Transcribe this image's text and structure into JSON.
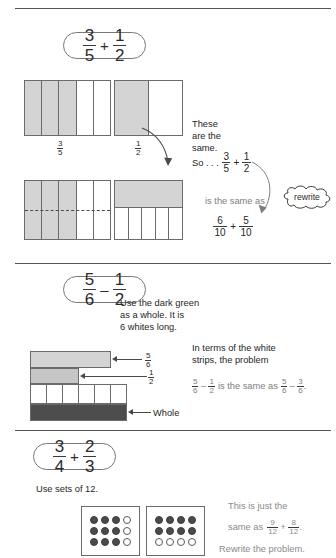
{
  "meta": {
    "colors": {
      "shade": "#d4d4d4",
      "dark_strip": "#4d4d4d",
      "rule": "#555555",
      "outline": "#6b6b6b",
      "grey_text": "#7d7d7d",
      "body_text": "#262626"
    }
  },
  "section1": {
    "problem": {
      "left": {
        "num": "3",
        "den": "5"
      },
      "operator": "+",
      "right": {
        "num": "1",
        "den": "2"
      }
    },
    "labels": {
      "three_fifths": {
        "num": "3",
        "den": "5"
      },
      "one_half": {
        "num": "1",
        "den": "2"
      }
    },
    "notes": {
      "line1": "These",
      "line2": "are the",
      "line3": "same.",
      "so_prefix": "So . . .",
      "so_left": {
        "num": "3",
        "den": "5"
      },
      "so_operator": "+",
      "so_right": {
        "num": "1",
        "den": "2"
      },
      "is_same_as": "is the same as",
      "result_left": {
        "num": "6",
        "den": "10"
      },
      "result_operator": "+",
      "result_right": {
        "num": "5",
        "den": "10"
      },
      "cloud_label": "rewrite"
    },
    "models": {
      "top_left_bar": {
        "parts": 5,
        "shaded": 3,
        "label": "3/5"
      },
      "top_right_bar": {
        "parts": 2,
        "shaded": 1,
        "label": "1/2"
      },
      "bottom_left_bar": {
        "parts": 5,
        "shaded": 3,
        "horizontal_split": true,
        "split_style": "dashed",
        "label": "6/10"
      },
      "bottom_right_bar": {
        "top_shaded": true,
        "bottom_parts": 5,
        "label": "5/10"
      }
    }
  },
  "section2": {
    "problem": {
      "left": {
        "num": "5",
        "den": "6"
      },
      "operator": "–",
      "right": {
        "num": "1",
        "den": "2"
      }
    },
    "instruction": {
      "line1": "Use the dark green",
      "line2": "as a whole. It is",
      "line3": "6 whites long."
    },
    "strip_labels": {
      "five_sixths": {
        "num": "5",
        "den": "6"
      },
      "one_half": {
        "num": "1",
        "den": "2"
      },
      "whole": "Whole"
    },
    "explanation": {
      "line1": "In terms of the white",
      "line2": "strips, the problem",
      "eq_left": {
        "num": "5",
        "den": "6"
      },
      "eq_operator": "–",
      "eq_right": {
        "num": "1",
        "den": "2"
      },
      "eq_middle": "is the same as",
      "eq_result_left": {
        "num": "5",
        "den": "6"
      },
      "eq_result_operator": "–",
      "eq_result_right": {
        "num": "3",
        "den": "6"
      },
      "eq_period": "."
    },
    "models": {
      "five_sixths_strip": {
        "units": 5,
        "of_total": 6,
        "shade": "light-green"
      },
      "one_half_strip": {
        "units": 3,
        "of_total": 6,
        "shade": "mid-green"
      },
      "white_strip_row": {
        "units": 6
      },
      "whole_strip": {
        "units": 6,
        "shade": "dark-green"
      }
    }
  },
  "section3": {
    "problem": {
      "left": {
        "num": "3",
        "den": "4"
      },
      "operator": "+",
      "right": {
        "num": "2",
        "den": "3"
      }
    },
    "instruction": "Use sets of 12.",
    "explanation": {
      "line1": "This is just the",
      "line2_prefix": "same as",
      "eq_left": {
        "num": "9",
        "den": "12"
      },
      "eq_operator": "+",
      "eq_right": {
        "num": "8",
        "den": "12"
      },
      "eq_period": ".",
      "line3": "Rewrite the problem."
    },
    "dot_sets": [
      {
        "name": "three-fourths-set",
        "rows": 3,
        "cols": 4,
        "filled_count": 9,
        "empty_count": 3,
        "pattern": [
          [
            "full",
            "full",
            "full",
            "empty"
          ],
          [
            "full",
            "full",
            "full",
            "empty"
          ],
          [
            "full",
            "full",
            "full",
            "empty"
          ]
        ]
      },
      {
        "name": "two-thirds-set",
        "rows": 3,
        "cols": 4,
        "filled_count": 8,
        "empty_count": 4,
        "pattern": [
          [
            "full",
            "full",
            "full",
            "full"
          ],
          [
            "full",
            "full",
            "full",
            "full"
          ],
          [
            "empty",
            "empty",
            "empty",
            "empty"
          ]
        ]
      }
    ]
  }
}
